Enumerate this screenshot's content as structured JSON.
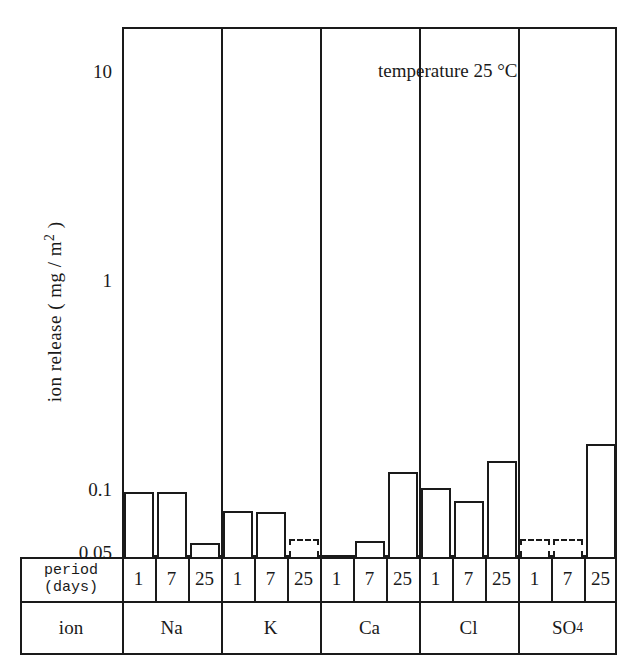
{
  "chart_data": {
    "type": "bar",
    "title": "",
    "annotation": "temperature 25 °C",
    "xlabel": "",
    "ylabel": "ion release ( mg / m² )",
    "ylabel_parts": {
      "prefix": "ion release ( mg / m",
      "exponent": "2",
      "suffix": " )"
    },
    "yscale": "log",
    "ylim": [
      0.042,
      20
    ],
    "ytick_labels": [
      "10",
      "1",
      "0.1",
      "0.05"
    ],
    "ytick_values": [
      10,
      1,
      0.1,
      0.05
    ],
    "grid": false,
    "legend": "none",
    "categories": [
      "Na",
      "K",
      "Ca",
      "Cl",
      "SO4"
    ],
    "periods": [
      "1",
      "7",
      "25"
    ],
    "row_headers": {
      "period": "period",
      "period_unit": "(days)",
      "ion": "ion"
    },
    "ion_labels": [
      {
        "text": "Na",
        "base": "Na",
        "sub": ""
      },
      {
        "text": "K",
        "base": "K",
        "sub": ""
      },
      {
        "text": "Ca",
        "base": "Ca",
        "sub": ""
      },
      {
        "text": "Cl",
        "base": "Cl",
        "sub": ""
      },
      {
        "text": "SO4",
        "base": "SO",
        "sub": "4"
      }
    ],
    "series": [
      {
        "name": "1 day",
        "values": [
          0.1,
          0.081,
          null,
          0.105,
          null
        ]
      },
      {
        "name": "7 days",
        "values": [
          0.1,
          0.08,
          0.058,
          0.091,
          null
        ]
      },
      {
        "name": "25 days",
        "values": [
          0.057,
          null,
          0.125,
          0.14,
          0.17
        ]
      }
    ],
    "points": [
      {
        "ion": "Na",
        "period": "1",
        "value": 0.1,
        "trace": false
      },
      {
        "ion": "Na",
        "period": "7",
        "value": 0.1,
        "trace": false
      },
      {
        "ion": "Na",
        "period": "25",
        "value": 0.057,
        "trace": false
      },
      {
        "ion": "K",
        "period": "1",
        "value": 0.081,
        "trace": false
      },
      {
        "ion": "K",
        "period": "7",
        "value": 0.08,
        "trace": false
      },
      {
        "ion": "K",
        "period": "25",
        "value": 0.046,
        "trace": true
      },
      {
        "ion": "Ca",
        "period": "1",
        "value": null,
        "trace": false
      },
      {
        "ion": "Ca",
        "period": "7",
        "value": 0.058,
        "trace": false
      },
      {
        "ion": "Ca",
        "period": "25",
        "value": 0.125,
        "trace": false
      },
      {
        "ion": "Cl",
        "period": "1",
        "value": 0.105,
        "trace": false
      },
      {
        "ion": "Cl",
        "period": "7",
        "value": 0.091,
        "trace": false
      },
      {
        "ion": "Cl",
        "period": "25",
        "value": 0.14,
        "trace": false
      },
      {
        "ion": "SO4",
        "period": "1",
        "value": 0.046,
        "trace": true
      },
      {
        "ion": "SO4",
        "period": "7",
        "value": 0.046,
        "trace": true
      },
      {
        "ion": "SO4",
        "period": "25",
        "value": 0.17,
        "trace": false
      }
    ]
  },
  "colors": {
    "ink": "#1a1a1a",
    "paper": "#ffffff"
  }
}
